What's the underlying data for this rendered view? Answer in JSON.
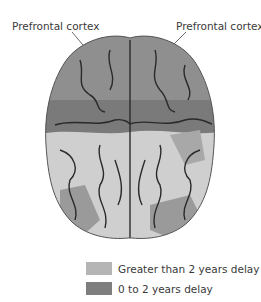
{
  "labels": {
    "left": "Prefrontal cortex",
    "right": "Prefrontal cortex"
  },
  "legend": {
    "items": [
      {
        "label": "Greater than 2 years delay",
        "color": "#b5b5b5"
      },
      {
        "label": "0 to 2 years delay",
        "color": "#7e7e7e"
      }
    ]
  },
  "colors": {
    "frontal_region": "#8f8f8f",
    "posterior_region": "#cfcfcf",
    "band_dark": "#7a7a7a",
    "sulci": "#2a2a2a"
  }
}
